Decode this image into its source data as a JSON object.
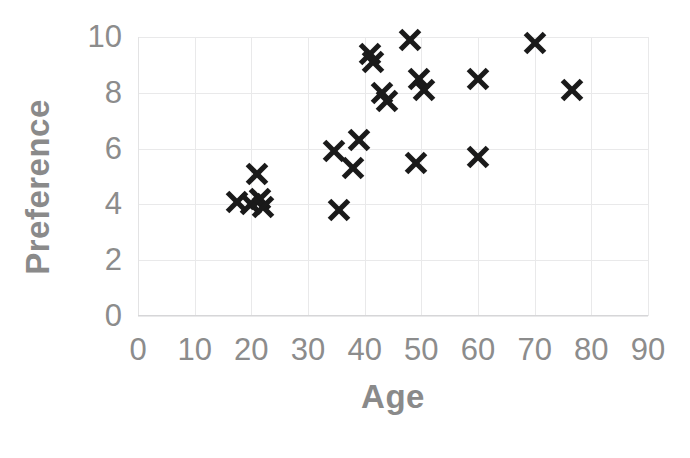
{
  "chart_data": {
    "type": "scatter",
    "title": "",
    "xlabel": "Age",
    "ylabel": "Preference",
    "xlim": [
      0,
      90
    ],
    "ylim": [
      0,
      10
    ],
    "xticks": [
      "0",
      "10",
      "20",
      "30",
      "40",
      "50",
      "60",
      "70",
      "80",
      "90"
    ],
    "yticks": [
      "0",
      "2",
      "4",
      "6",
      "8",
      "10"
    ],
    "grid": true,
    "legend": "none",
    "marker_style": "x",
    "marker_color": "#1a1a1a",
    "axis_text_color": "#8c8c8c",
    "axis_title_color": "#8a8a8a",
    "grid_color": "#e9e9ea",
    "background_color": "#ffffff",
    "series": [
      {
        "name": "Age vs Preference",
        "points": [
          {
            "x": 17.5,
            "y": 4.1
          },
          {
            "x": 20.0,
            "y": 4.0
          },
          {
            "x": 21.0,
            "y": 5.1
          },
          {
            "x": 21.5,
            "y": 4.2
          },
          {
            "x": 22.0,
            "y": 3.9
          },
          {
            "x": 34.5,
            "y": 5.9
          },
          {
            "x": 35.5,
            "y": 3.8
          },
          {
            "x": 38.0,
            "y": 5.3
          },
          {
            "x": 39.0,
            "y": 6.3
          },
          {
            "x": 41.0,
            "y": 9.4
          },
          {
            "x": 41.5,
            "y": 9.1
          },
          {
            "x": 43.0,
            "y": 8.0
          },
          {
            "x": 44.0,
            "y": 7.7
          },
          {
            "x": 48.0,
            "y": 9.9
          },
          {
            "x": 49.0,
            "y": 5.5
          },
          {
            "x": 49.5,
            "y": 8.5
          },
          {
            "x": 50.5,
            "y": 8.1
          },
          {
            "x": 60.0,
            "y": 8.5
          },
          {
            "x": 60.0,
            "y": 5.7
          },
          {
            "x": 70.0,
            "y": 9.8
          },
          {
            "x": 76.5,
            "y": 8.1
          }
        ]
      }
    ]
  }
}
